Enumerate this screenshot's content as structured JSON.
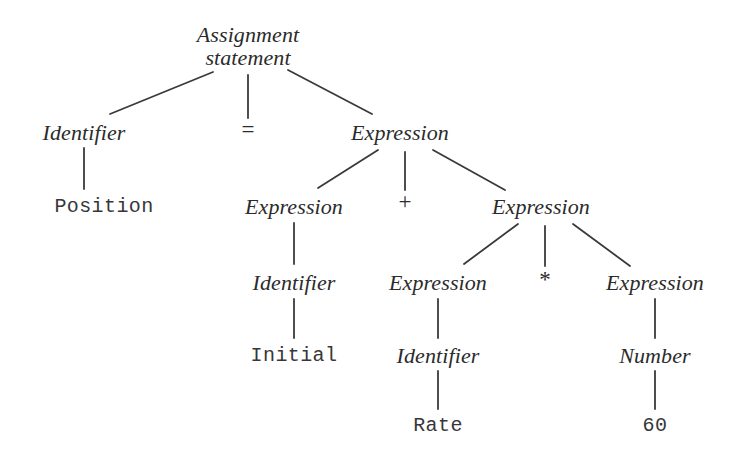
{
  "diagram": {
    "type": "parse-tree",
    "background_color": "#ffffff",
    "text_color": "#2b2b2b",
    "edge_color": "#3a3a3c",
    "source_expression": "Position = Initial + Rate * 60",
    "nodes": [
      {
        "id": "n0",
        "label": "Assignment",
        "label_line2": "statement",
        "kind": "nonterminal",
        "x": 248,
        "y": 46
      },
      {
        "id": "n1",
        "label": "Identifier",
        "kind": "nonterminal",
        "x": 84,
        "y": 133
      },
      {
        "id": "n2",
        "label": "=",
        "kind": "operator",
        "x": 248,
        "y": 130
      },
      {
        "id": "n3",
        "label": "Expression",
        "kind": "nonterminal",
        "x": 400,
        "y": 133
      },
      {
        "id": "n4",
        "label": "Position",
        "kind": "terminal",
        "x": 104,
        "y": 207
      },
      {
        "id": "n5",
        "label": "Expression",
        "kind": "nonterminal",
        "x": 294,
        "y": 207
      },
      {
        "id": "n6",
        "label": "+",
        "kind": "operator",
        "x": 405,
        "y": 202
      },
      {
        "id": "n7",
        "label": "Expression",
        "kind": "nonterminal",
        "x": 541,
        "y": 207
      },
      {
        "id": "n8",
        "label": "Identifier",
        "kind": "nonterminal",
        "x": 294,
        "y": 283
      },
      {
        "id": "n9",
        "label": "Expression",
        "kind": "nonterminal",
        "x": 438,
        "y": 283
      },
      {
        "id": "n10",
        "label": "*",
        "kind": "operator",
        "x": 545,
        "y": 280
      },
      {
        "id": "n11",
        "label": "Expression",
        "kind": "nonterminal",
        "x": 655,
        "y": 283
      },
      {
        "id": "n12",
        "label": "Initial",
        "kind": "terminal",
        "x": 294,
        "y": 356
      },
      {
        "id": "n13",
        "label": "Identifier",
        "kind": "nonterminal",
        "x": 438,
        "y": 356
      },
      {
        "id": "n14",
        "label": "Number",
        "kind": "nonterminal",
        "x": 655,
        "y": 356
      },
      {
        "id": "n15",
        "label": "Rate",
        "kind": "terminal",
        "x": 438,
        "y": 426
      },
      {
        "id": "n16",
        "label": "60",
        "kind": "terminal",
        "x": 655,
        "y": 426
      }
    ],
    "edges": [
      {
        "from": "n0",
        "to": "n1",
        "x1": 213,
        "y1": 72,
        "x2": 110,
        "y2": 114
      },
      {
        "from": "n0",
        "to": "n2",
        "x1": 248,
        "y1": 75,
        "x2": 248,
        "y2": 118
      },
      {
        "from": "n0",
        "to": "n3",
        "x1": 288,
        "y1": 70,
        "x2": 372,
        "y2": 114
      },
      {
        "from": "n1",
        "to": "n4",
        "x1": 84,
        "y1": 148,
        "x2": 84,
        "y2": 189
      },
      {
        "from": "n3",
        "to": "n5",
        "x1": 378,
        "y1": 150,
        "x2": 318,
        "y2": 188
      },
      {
        "from": "n3",
        "to": "n6",
        "x1": 405,
        "y1": 152,
        "x2": 405,
        "y2": 190
      },
      {
        "from": "n3",
        "to": "n7",
        "x1": 433,
        "y1": 150,
        "x2": 505,
        "y2": 190
      },
      {
        "from": "n5",
        "to": "n8",
        "x1": 294,
        "y1": 223,
        "x2": 294,
        "y2": 264
      },
      {
        "from": "n7",
        "to": "n9",
        "x1": 518,
        "y1": 224,
        "x2": 464,
        "y2": 264
      },
      {
        "from": "n7",
        "to": "n10",
        "x1": 545,
        "y1": 226,
        "x2": 545,
        "y2": 266
      },
      {
        "from": "n7",
        "to": "n11",
        "x1": 573,
        "y1": 224,
        "x2": 630,
        "y2": 266
      },
      {
        "from": "n8",
        "to": "n12",
        "x1": 294,
        "y1": 299,
        "x2": 294,
        "y2": 338
      },
      {
        "from": "n9",
        "to": "n13",
        "x1": 438,
        "y1": 299,
        "x2": 438,
        "y2": 338
      },
      {
        "from": "n11",
        "to": "n14",
        "x1": 655,
        "y1": 299,
        "x2": 655,
        "y2": 338
      },
      {
        "from": "n13",
        "to": "n15",
        "x1": 438,
        "y1": 371,
        "x2": 438,
        "y2": 409
      },
      {
        "from": "n14",
        "to": "n16",
        "x1": 655,
        "y1": 371,
        "x2": 655,
        "y2": 409
      }
    ]
  }
}
